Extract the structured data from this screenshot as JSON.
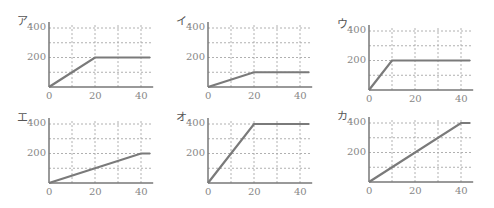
{
  "chart_data": [
    {
      "type": "line",
      "title": "ア.",
      "x": [
        0,
        20,
        44
      ],
      "y": [
        0,
        200,
        200
      ],
      "xticks": [
        0,
        20,
        40
      ],
      "yticks": [
        200,
        400
      ],
      "xlim": [
        0,
        44
      ],
      "ylim": [
        0,
        400
      ],
      "grid": true
    },
    {
      "type": "line",
      "title": "イ.",
      "x": [
        0,
        20,
        44
      ],
      "y": [
        0,
        100,
        100
      ],
      "xticks": [
        0,
        20,
        40
      ],
      "yticks": [
        200,
        400
      ],
      "xlim": [
        0,
        44
      ],
      "ylim": [
        0,
        400
      ],
      "grid": true
    },
    {
      "type": "line",
      "title": "ウ.",
      "x": [
        0,
        10,
        44
      ],
      "y": [
        0,
        200,
        200
      ],
      "xticks": [
        0,
        20,
        40
      ],
      "yticks": [
        200,
        400
      ],
      "xlim": [
        0,
        44
      ],
      "ylim": [
        0,
        400
      ],
      "grid": true
    },
    {
      "type": "line",
      "title": "エ.",
      "x": [
        0,
        40,
        44
      ],
      "y": [
        0,
        200,
        200
      ],
      "xticks": [
        0,
        20,
        40
      ],
      "yticks": [
        200,
        400
      ],
      "xlim": [
        0,
        44
      ],
      "ylim": [
        0,
        400
      ],
      "grid": true
    },
    {
      "type": "line",
      "title": "オ.",
      "x": [
        0,
        20,
        44
      ],
      "y": [
        0,
        400,
        400
      ],
      "xticks": [
        0,
        20,
        40
      ],
      "yticks": [
        200,
        400
      ],
      "xlim": [
        0,
        44
      ],
      "ylim": [
        0,
        400
      ],
      "grid": true
    },
    {
      "type": "line",
      "title": "カ.",
      "x": [
        0,
        40,
        44
      ],
      "y": [
        0,
        400,
        400
      ],
      "xticks": [
        0,
        20,
        40
      ],
      "yticks": [
        200,
        400
      ],
      "xlim": [
        0,
        44
      ],
      "ylim": [
        0,
        400
      ],
      "grid": true
    }
  ],
  "panels": [
    {
      "label": "ア.",
      "ox": 49,
      "oy": 87,
      "y400": 28
    },
    {
      "label": "イ.",
      "ox": 208,
      "oy": 87,
      "y400": 28
    },
    {
      "label": "ウ.",
      "ox": 369,
      "oy": 90,
      "y400": 31
    },
    {
      "label": "エ.",
      "ox": 49,
      "oy": 183,
      "y400": 124
    },
    {
      "label": "オ.",
      "ox": 208,
      "oy": 183,
      "y400": 124
    },
    {
      "label": "カ.",
      "ox": 369,
      "oy": 182,
      "y400": 123
    }
  ],
  "style": {
    "line_color": "#7a7a7a",
    "grid_color": "#b0b0b0",
    "axis_color": "#777777",
    "text_color": "#888888"
  }
}
